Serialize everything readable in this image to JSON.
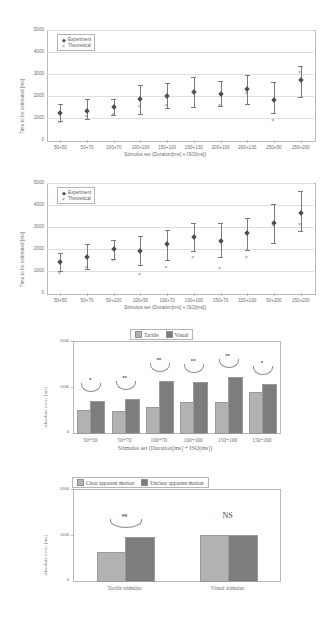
{
  "page": {
    "width": 330,
    "height": 623,
    "background": "#ffffff"
  },
  "colors": {
    "tactile_light": "#b2b2b2",
    "visual_dark": "#7d7d7d",
    "marker_dark": "#4d4d4d",
    "marker_theoretical": "#808080",
    "axis": "#b9b9b9",
    "text": "#6d6d6d"
  },
  "chart_data": [
    {
      "id": "chart1",
      "type": "scatter",
      "title": "",
      "xlabel": "Stimulus set (Duration[ms] + ISO[ms])",
      "ylabel": "Time to be estimated [ms]",
      "ylim": [
        0,
        5000
      ],
      "yticks": [
        0,
        1000,
        2000,
        3000,
        4000,
        5000
      ],
      "grid": true,
      "legend_position": "top-left",
      "categories": [
        "50+50",
        "50+70",
        "100+70",
        "100+100",
        "150+100",
        "150+130",
        "200+100",
        "200+130",
        "250+50",
        "150+200"
      ],
      "series": [
        {
          "name": "Experiment",
          "marker": "filled-diamond",
          "values": [
            1220,
            1300,
            1520,
            1850,
            1990,
            2160,
            2100,
            2330,
            1840,
            2740
          ],
          "err_low": [
            350,
            330,
            380,
            650,
            520,
            650,
            560,
            700,
            620,
            780
          ],
          "err_high": [
            430,
            580,
            330,
            630,
            600,
            710,
            590,
            640,
            790,
            640
          ]
        },
        {
          "name": "Theoretical",
          "marker": "x",
          "values": [
            790,
            1070,
            1130,
            1510,
            1560,
            2110,
            1570,
            2090,
            880,
            3060
          ]
        }
      ]
    },
    {
      "id": "chart2",
      "type": "scatter",
      "title": "",
      "xlabel": "Stimulus set (Duration[ms] + ISO[ms])",
      "ylabel": "Time to be estimated [ms]",
      "ylim": [
        0,
        5000
      ],
      "yticks": [
        0,
        1000,
        2000,
        3000,
        4000,
        5000
      ],
      "grid": true,
      "legend_position": "top-left",
      "categories": [
        "50+50",
        "50+70",
        "50+100",
        "100+50",
        "100+70",
        "100+100",
        "150+70",
        "150+100",
        "50+200",
        "150+200"
      ],
      "series": [
        {
          "name": "Experiment",
          "marker": "filled-diamond",
          "values": [
            1400,
            1650,
            1980,
            1890,
            2210,
            2540,
            2350,
            2710,
            3200,
            3620
          ],
          "err_low": [
            420,
            560,
            450,
            620,
            700,
            650,
            700,
            760,
            910,
            800
          ],
          "err_high": [
            440,
            580,
            420,
            690,
            650,
            660,
            810,
            720,
            840,
            1010
          ]
        },
        {
          "name": "Theoretical",
          "marker": "x",
          "values": [
            860,
            1130,
            1470,
            840,
            1140,
            1610,
            1110,
            1600,
            3080,
            3090
          ]
        }
      ]
    },
    {
      "id": "chart3",
      "type": "bar",
      "title": "",
      "xlabel": "Stimulus set (Duration[ms] + ISO[ms])",
      "ylabel": "Absolute error [ms]",
      "ylim": [
        0,
        2000
      ],
      "yticks": [
        0,
        1000,
        2000
      ],
      "grid": false,
      "legend_position": "top",
      "categories": [
        "50+50",
        "50+70",
        "100+70",
        "100+100",
        "150+100",
        "150+200"
      ],
      "series": [
        {
          "name": "Tactile",
          "color": "#b2b2b2",
          "values": [
            490,
            460,
            540,
            650,
            660,
            880
          ]
        },
        {
          "name": "Visual",
          "color": "#7d7d7d",
          "values": [
            680,
            720,
            1130,
            1100,
            1210,
            1060
          ]
        }
      ],
      "annotations": [
        {
          "category": "50+50",
          "label": "*"
        },
        {
          "category": "50+70",
          "label": "**"
        },
        {
          "category": "100+70",
          "label": "**"
        },
        {
          "category": "100+100",
          "label": "**"
        },
        {
          "category": "150+100",
          "label": "**"
        },
        {
          "category": "150+200",
          "label": "*"
        }
      ]
    },
    {
      "id": "chart4",
      "type": "bar",
      "title": "",
      "xlabel": "",
      "ylabel": "Absolute error [ms]",
      "ylim": [
        0,
        2000
      ],
      "yticks": [
        0,
        1000,
        2000
      ],
      "grid": false,
      "legend_position": "top",
      "categories": [
        "Tactile stimulus",
        "Visual stimulus"
      ],
      "series": [
        {
          "name": "Clear apparent motion",
          "color": "#b2b2b2",
          "values": [
            620,
            1000
          ]
        },
        {
          "name": "Unclear apparent motion",
          "color": "#7d7d7d",
          "values": [
            940,
            995
          ]
        }
      ],
      "annotations": [
        {
          "category": "Tactile stimulus",
          "label": "**"
        },
        {
          "category": "Visual stimulus",
          "label": "NS"
        }
      ]
    }
  ]
}
